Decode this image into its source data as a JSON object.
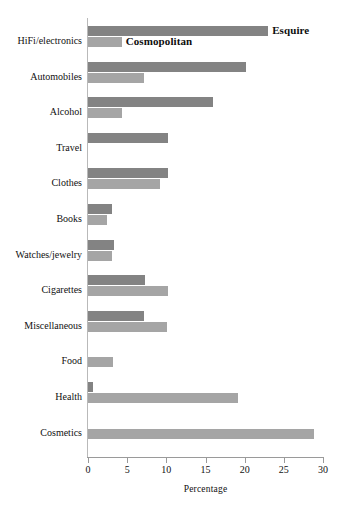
{
  "chart_data": {
    "type": "bar",
    "orientation": "horizontal",
    "title": "",
    "subtitle": "",
    "xlabel": "Percentage",
    "ylabel": "",
    "xlim": [
      0,
      30
    ],
    "xticks": [
      0,
      5,
      10,
      15,
      20,
      25,
      30
    ],
    "xtick_labels": [
      "0",
      "5",
      "10",
      "15",
      "20",
      "25",
      "30"
    ],
    "grid": false,
    "legend_position": "inline-top",
    "categories": [
      "HiFi/electronics",
      "Automobiles",
      "Alcohol",
      "Travel",
      "Clothes",
      "Books",
      "Watches/jewelry",
      "Cigarettes",
      "Miscellaneous",
      "Food",
      "Health",
      "Cosmetics"
    ],
    "series": [
      {
        "name": "Esquire",
        "color": "#838383",
        "values": [
          23.0,
          20.2,
          16.0,
          10.2,
          10.2,
          3.1,
          3.3,
          7.3,
          7.2,
          0.0,
          0.7,
          0.0
        ]
      },
      {
        "name": "Cosmopolitan",
        "color": "#a5a5a5",
        "values": [
          4.3,
          7.2,
          4.3,
          0.0,
          9.2,
          2.4,
          3.1,
          10.2,
          10.1,
          3.2,
          19.2,
          28.9
        ]
      }
    ],
    "annotations": [
      {
        "text": "Esquire",
        "series": "Esquire",
        "at_category": "HiFi/electronics"
      },
      {
        "text": "Cosmopolitan",
        "series": "Cosmopolitan",
        "at_category": "HiFi/electronics"
      }
    ]
  }
}
